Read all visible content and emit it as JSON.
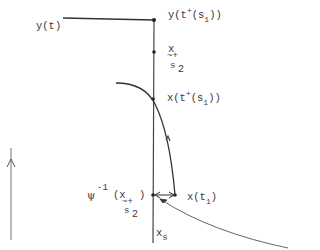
{
  "diagram": {
    "labels": {
      "y_t": "y(t)",
      "y_tplus_s1": {
        "pre": "y(t",
        "sup": "+",
        "mid": "(s",
        "sub": "1",
        "post": "))"
      },
      "x_s2": {
        "base": "x",
        "tilde": "~+",
        "sub_s": "s",
        "sub_2": "2"
      },
      "x_tplus_s1": {
        "pre": "x(t",
        "sup": "+",
        "mid": "(s",
        "sub": "1",
        "post": "))"
      },
      "psi_inv": {
        "psi": "ψ",
        "sup": "-1",
        "open": "(x",
        "tilde": "~+",
        "close": ")",
        "sub_s": "s",
        "sub_2": "2"
      },
      "x_t1": {
        "pre": "x(t",
        "sub": "1",
        "post": ")"
      },
      "x_s": {
        "base": "x",
        "sub": "s"
      }
    },
    "stroke_color": "#333333"
  }
}
